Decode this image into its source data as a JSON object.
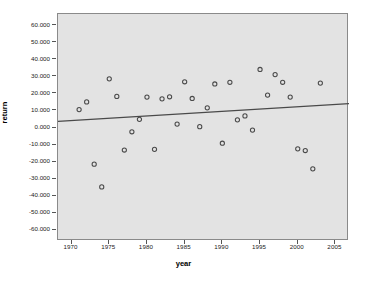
{
  "chart_data": {
    "type": "scatter",
    "title": "",
    "xlabel": "year",
    "ylabel": "return",
    "xlim": [
      1968.2,
      2006.8
    ],
    "ylim": [
      -66.5,
      66.5
    ],
    "grid": false,
    "legend": null,
    "x_ticks": [
      "1970",
      "1975",
      "1980",
      "1985",
      "1990",
      "1995",
      "2000",
      "2005"
    ],
    "x_tick_values": [
      1970,
      1975,
      1980,
      1985,
      1990,
      1995,
      2000,
      2005
    ],
    "y_ticks": [
      "60.000",
      "50.000",
      "40.000",
      "30.000",
      "20.000",
      "10.000",
      "0.000",
      "-10.000",
      "-20.000",
      "-30.000",
      "-40.000",
      "-50.000",
      "-60.000"
    ],
    "y_tick_values": [
      60,
      50,
      40,
      30,
      20,
      10,
      0,
      -10,
      -20,
      -30,
      -40,
      -50,
      -60
    ],
    "marker": "open-circle",
    "marker_color": "#4a4a4a",
    "plot_background": "#e3e3e3",
    "frame_color": "#8a8a8a",
    "x": [
      1971,
      1972,
      1973,
      1974,
      1975,
      1976,
      1977,
      1978,
      1979,
      1980,
      1981,
      1982,
      1983,
      1984,
      1985,
      1986,
      1987,
      1988,
      1989,
      1990,
      1991,
      1992,
      1993,
      1994,
      1995,
      1996,
      1997,
      1998,
      1999,
      2000,
      2001,
      2002,
      2003
    ],
    "y": [
      10.5,
      15.0,
      -21.5,
      -34.8,
      28.5,
      18.2,
      -13.2,
      -2.5,
      4.8,
      17.8,
      -12.8,
      16.8,
      18.0,
      2.0,
      26.8,
      17.0,
      0.5,
      11.5,
      25.5,
      -9.2,
      26.5,
      4.5,
      6.8,
      -1.5,
      34.0,
      19.0,
      31.0,
      26.5,
      17.8,
      -12.5,
      -13.5,
      -24.2,
      26.0
    ],
    "fit_line": {
      "type": "linear",
      "x_start": 1968.2,
      "y_start": 3.6,
      "x_end": 2006.8,
      "y_end": 14.0,
      "color": "#4a4a4a"
    }
  }
}
